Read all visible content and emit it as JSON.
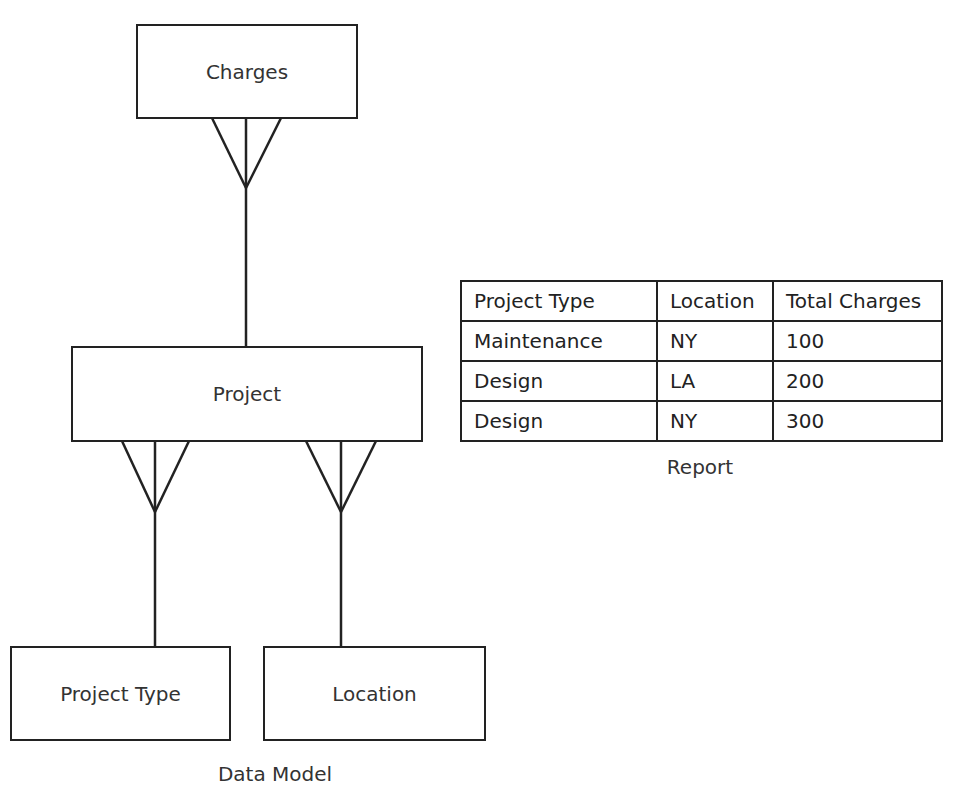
{
  "diagram": {
    "entities": {
      "charges": "Charges",
      "project": "Project",
      "project_type": "Project Type",
      "location": "Location"
    },
    "caption": "Data Model",
    "relationships": [
      {
        "from": "Project",
        "to": "Charges",
        "type": "one-to-many"
      },
      {
        "from": "Project Type",
        "to": "Project",
        "type": "one-to-many"
      },
      {
        "from": "Location",
        "to": "Project",
        "type": "one-to-many"
      }
    ]
  },
  "report": {
    "caption": "Report",
    "headers": [
      "Project Type",
      "Location",
      "Total Charges"
    ],
    "rows": [
      [
        "Maintenance",
        "NY",
        "100"
      ],
      [
        "Design",
        "LA",
        "200"
      ],
      [
        "Design",
        "NY",
        "300"
      ]
    ]
  },
  "colors": {
    "line": "#222222",
    "text": "#333333",
    "background": "#ffffff"
  }
}
